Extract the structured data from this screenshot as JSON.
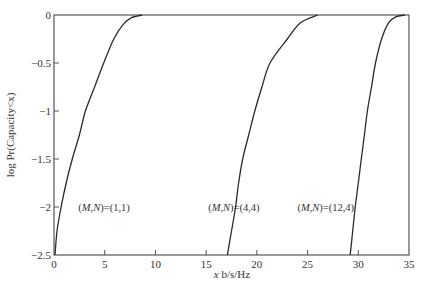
{
  "chart_data": {
    "type": "line",
    "title": "",
    "xlabel": "x b/s/Hz",
    "ylabel": "log Pr(Capacity<x)",
    "xlim": [
      0,
      35
    ],
    "ylim": [
      -2.5,
      0
    ],
    "grid": false,
    "legend": "none (inline annotations)",
    "x_ticks": [
      0,
      5,
      10,
      15,
      20,
      25,
      30,
      35
    ],
    "y_ticks": [
      0,
      -0.5,
      -1,
      -1.5,
      -2,
      -2.5
    ],
    "x_tick_labels": [
      "0",
      "5",
      "10",
      "15",
      "20",
      "25",
      "30",
      "35"
    ],
    "y_tick_labels": [
      "0",
      "-0.5",
      "-1",
      "-1.5",
      "-2",
      "-2.5"
    ],
    "series": [
      {
        "name": "(M,N)=(1,1)",
        "points": [
          [
            0.1,
            -2.5
          ],
          [
            0.3,
            -2.25
          ],
          [
            0.7,
            -2.0
          ],
          [
            1.2,
            -1.75
          ],
          [
            1.8,
            -1.5
          ],
          [
            2.5,
            -1.25
          ],
          [
            3.1,
            -1.0
          ],
          [
            4.0,
            -0.75
          ],
          [
            4.9,
            -0.5
          ],
          [
            5.9,
            -0.25
          ],
          [
            6.8,
            -0.1
          ],
          [
            7.6,
            -0.03
          ],
          [
            8.7,
            0.0
          ]
        ]
      },
      {
        "name": "(M,N)=(4,4)",
        "points": [
          [
            17.1,
            -2.5
          ],
          [
            17.5,
            -2.25
          ],
          [
            17.9,
            -2.0
          ],
          [
            18.2,
            -1.75
          ],
          [
            18.6,
            -1.5
          ],
          [
            19.2,
            -1.25
          ],
          [
            19.8,
            -1.0
          ],
          [
            20.5,
            -0.75
          ],
          [
            21.3,
            -0.5
          ],
          [
            23.0,
            -0.25
          ],
          [
            24.3,
            -0.08
          ],
          [
            26.0,
            0.0
          ]
        ]
      },
      {
        "name": "(M,N)=(12,4)",
        "points": [
          [
            29.2,
            -2.5
          ],
          [
            29.45,
            -2.25
          ],
          [
            29.7,
            -2.0
          ],
          [
            30.0,
            -1.75
          ],
          [
            30.3,
            -1.5
          ],
          [
            30.6,
            -1.25
          ],
          [
            30.9,
            -1.0
          ],
          [
            31.3,
            -0.75
          ],
          [
            31.7,
            -0.5
          ],
          [
            32.3,
            -0.25
          ],
          [
            33.0,
            -0.08
          ],
          [
            33.7,
            -0.02
          ],
          [
            34.6,
            0.0
          ]
        ]
      }
    ],
    "annotations": [
      {
        "text": "(M,N)=(1,1)",
        "x": 2.4,
        "y": -2.0
      },
      {
        "text": "(M,N)=(4,4)",
        "x": 15.2,
        "y": -2.0
      },
      {
        "text": "(M,N)=(12,4)",
        "x": 24.0,
        "y": -2.0
      }
    ]
  },
  "labels": {
    "xlabel": "x b/s/Hz",
    "ylabel": "log Pr(Capacity<x)",
    "annot_1": "(M,N)=(1,1)",
    "annot_2": "(M,N)=(4,4)",
    "annot_3": "(M,N)=(12,4)"
  },
  "colors": {
    "line": "#2a2a2a",
    "axis": "#555555"
  }
}
